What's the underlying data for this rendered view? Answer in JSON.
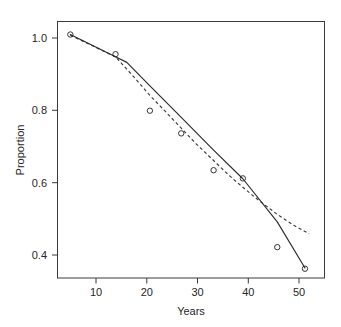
{
  "chart_data": {
    "type": "scatter",
    "title": "",
    "subtitle": "",
    "xlabel": "Years",
    "ylabel": "Proportion",
    "xlim": [
      3.0,
      55.0
    ],
    "ylim": [
      0.345,
      1.035
    ],
    "xticks": [
      10,
      20,
      30,
      40,
      50
    ],
    "xticklabels": [
      "10",
      "20",
      "30",
      "40",
      "50"
    ],
    "yticks": [
      0.4,
      0.6,
      0.8,
      1.0
    ],
    "yticklabels": [
      "0.4",
      "0.6",
      "0.8",
      "1.0"
    ],
    "grid": false,
    "legend": null,
    "legend_position": "none",
    "annotations": [],
    "points": {
      "name": "observed-proportion",
      "marker": "open-circle",
      "x": [
        5.5,
        14.3,
        21.0,
        27.1,
        33.4,
        39.1,
        45.8,
        51.2
      ],
      "y": [
        1.0,
        0.947,
        0.795,
        0.734,
        0.635,
        0.613,
        0.428,
        0.37
      ]
    },
    "series": [
      {
        "name": "solid-fit",
        "style": "solid",
        "x": [
          5.5,
          14.3,
          16.5,
          21.0,
          27.1,
          33.4,
          39.1,
          45.8,
          51.2
        ],
        "y": [
          1.0,
          0.94,
          0.925,
          0.862,
          0.777,
          0.689,
          0.612,
          0.496,
          0.372
        ]
      },
      {
        "name": "dashed-fit",
        "style": "dashed",
        "x": [
          5.5,
          9.0,
          14.3,
          18.0,
          21.0,
          24.0,
          27.1,
          30.0,
          33.4,
          36.5,
          39.1,
          42.0,
          45.8,
          49.0,
          52.0
        ],
        "y": [
          0.998,
          0.975,
          0.94,
          0.884,
          0.836,
          0.793,
          0.748,
          0.706,
          0.661,
          0.62,
          0.589,
          0.556,
          0.516,
          0.487,
          0.464
        ]
      }
    ]
  },
  "axes": {
    "x_axis_title": "Years",
    "y_axis_title": "Proportion"
  }
}
